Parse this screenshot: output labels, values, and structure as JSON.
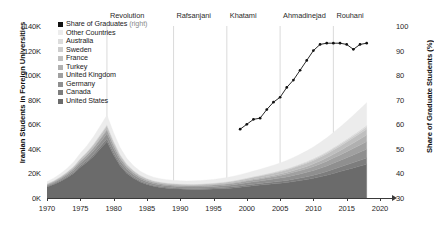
{
  "chart_data": {
    "type": "area",
    "title": "",
    "xlabel": "",
    "ylabel": "Iranian Students in Foreign Universities",
    "y2label": "Share of Graduate Students (%)",
    "xlim": [
      1970,
      2020
    ],
    "ylim": [
      0,
      140000
    ],
    "y2lim": [
      30,
      100
    ],
    "grid": false,
    "legend_position": "upper-left-inside",
    "x": [
      1970,
      1971,
      1972,
      1973,
      1974,
      1975,
      1976,
      1977,
      1978,
      1979,
      1980,
      1981,
      1982,
      1983,
      1984,
      1985,
      1986,
      1987,
      1988,
      1989,
      1990,
      1991,
      1992,
      1993,
      1994,
      1995,
      1996,
      1997,
      1998,
      1999,
      2000,
      2001,
      2002,
      2003,
      2004,
      2005,
      2006,
      2007,
      2008,
      2009,
      2010,
      2011,
      2012,
      2013,
      2014,
      2015,
      2016,
      2017,
      2018
    ],
    "xticks": [
      1970,
      1975,
      1980,
      1985,
      1990,
      1995,
      2000,
      2005,
      2010,
      2015,
      2020
    ],
    "xtick_labels": [
      "1970",
      "1975",
      "1980",
      "1985",
      "1990",
      "1995",
      "2000",
      "2005",
      "2010",
      "2015",
      "2020"
    ],
    "yticks": [
      0,
      20000,
      40000,
      60000,
      80000,
      100000,
      120000,
      140000
    ],
    "ytick_labels": [
      "0K",
      "20K",
      "40K",
      "60K",
      "80K",
      "100K",
      "120K",
      "140K"
    ],
    "y2ticks": [
      30,
      40,
      50,
      60,
      70,
      80,
      90,
      100
    ],
    "y2tick_labels": [
      "30",
      "40",
      "50",
      "60",
      "70",
      "80",
      "90",
      "100"
    ],
    "stack_order_bottom_to_top": [
      "United States",
      "Canada",
      "Germany",
      "United Kingdom",
      "Turkey",
      "France",
      "Sweden",
      "Australia",
      "Other Countries"
    ],
    "series": [
      {
        "name": "United States",
        "color": "#6b6b6b",
        "values": [
          9000,
          11000,
          13500,
          16500,
          20000,
          25000,
          29000,
          34000,
          40000,
          46000,
          35000,
          26000,
          20000,
          16000,
          13000,
          11000,
          9500,
          8600,
          8000,
          7600,
          7300,
          7100,
          7000,
          7000,
          7100,
          7300,
          7500,
          7800,
          8200,
          8800,
          9400,
          10000,
          10500,
          11000,
          11500,
          12000,
          12600,
          13400,
          14200,
          15000,
          16000,
          17200,
          18500,
          20000,
          21500,
          23000,
          24500,
          26000,
          27500
        ]
      },
      {
        "name": "Canada",
        "color": "#7d7d7d",
        "values": [
          400,
          500,
          600,
          750,
          950,
          1200,
          1400,
          1700,
          2000,
          2300,
          1900,
          1500,
          1200,
          1000,
          900,
          800,
          750,
          720,
          700,
          690,
          680,
          680,
          690,
          710,
          740,
          780,
          820,
          870,
          930,
          1000,
          1080,
          1160,
          1250,
          1350,
          1460,
          1580,
          1720,
          1880,
          2060,
          2260,
          2500,
          2760,
          3050,
          3360,
          3700,
          4050,
          4400,
          4750,
          5100
        ]
      },
      {
        "name": "Germany",
        "color": "#8f8f8f",
        "values": [
          800,
          950,
          1150,
          1400,
          1700,
          2100,
          2500,
          2900,
          3400,
          3900,
          3300,
          2700,
          2200,
          1850,
          1600,
          1450,
          1350,
          1290,
          1250,
          1230,
          1220,
          1220,
          1240,
          1270,
          1320,
          1380,
          1450,
          1530,
          1620,
          1730,
          1850,
          1980,
          2120,
          2280,
          2450,
          2640,
          2850,
          3080,
          3330,
          3600,
          3900,
          4220,
          4570,
          4940,
          5330,
          5740,
          6170,
          6620,
          7080
        ]
      },
      {
        "name": "United Kingdom",
        "color": "#a0a0a0",
        "values": [
          600,
          720,
          870,
          1060,
          1290,
          1580,
          1880,
          2200,
          2560,
          2950,
          2500,
          2050,
          1680,
          1400,
          1200,
          1080,
          1000,
          960,
          930,
          915,
          910,
          915,
          930,
          955,
          995,
          1045,
          1105,
          1175,
          1255,
          1345,
          1445,
          1555,
          1675,
          1810,
          1960,
          2125,
          2305,
          2505,
          2725,
          2965,
          3230,
          3520,
          3835,
          4175,
          4540,
          4930,
          5345,
          5780,
          6230
        ]
      },
      {
        "name": "Turkey",
        "color": "#b0b0b0",
        "values": [
          200,
          240,
          290,
          350,
          430,
          530,
          630,
          740,
          860,
          1000,
          850,
          700,
          580,
          490,
          430,
          390,
          365,
          350,
          342,
          338,
          338,
          342,
          352,
          368,
          390,
          418,
          452,
          492,
          540,
          595,
          660,
          735,
          820,
          920,
          1035,
          1165,
          1315,
          1485,
          1680,
          1900,
          2150,
          2430,
          2745,
          3095,
          3480,
          3900,
          4355,
          4840,
          5355
        ]
      },
      {
        "name": "France",
        "color": "#bfbfbf",
        "values": [
          500,
          600,
          730,
          890,
          1080,
          1320,
          1570,
          1840,
          2140,
          2470,
          2100,
          1720,
          1410,
          1180,
          1020,
          920,
          855,
          820,
          800,
          792,
          790,
          795,
          810,
          835,
          870,
          915,
          970,
          1035,
          1110,
          1195,
          1290,
          1395,
          1510,
          1635,
          1770,
          1915,
          2070,
          2235,
          2410,
          2595,
          2790,
          2995,
          3210,
          3435,
          3670,
          3915,
          4170,
          4435,
          4710
        ]
      },
      {
        "name": "Sweden",
        "color": "#cdcdcd",
        "values": [
          150,
          180,
          220,
          270,
          330,
          405,
          485,
          570,
          665,
          770,
          655,
          540,
          445,
          375,
          325,
          293,
          272,
          261,
          255,
          252,
          251,
          253,
          258,
          266,
          278,
          293,
          311,
          332,
          357,
          385,
          417,
          452,
          491,
          534,
          581,
          632,
          687,
          747,
          811,
          880,
          954,
          1033,
          1117,
          1206,
          1301,
          1401,
          1507,
          1618,
          1735
        ]
      },
      {
        "name": "Australia",
        "color": "#dcdcdc",
        "values": [
          120,
          145,
          175,
          215,
          262,
          322,
          385,
          453,
          528,
          612,
          520,
          430,
          354,
          298,
          258,
          233,
          216,
          207,
          202,
          200,
          199,
          201,
          205,
          211,
          221,
          233,
          247,
          264,
          284,
          307,
          333,
          362,
          394,
          429,
          468,
          510,
          556,
          606,
          660,
          718,
          780,
          846,
          917,
          992,
          1072,
          1156,
          1245,
          1339,
          1437
        ]
      },
      {
        "name": "Other Countries",
        "color": "#ececec",
        "values": [
          1500,
          1800,
          2190,
          2670,
          3250,
          3980,
          4740,
          5560,
          6460,
          7460,
          6340,
          5200,
          4270,
          3590,
          3110,
          2800,
          2600,
          2490,
          2430,
          2400,
          2395,
          2410,
          2460,
          2540,
          2650,
          2790,
          2960,
          3160,
          3390,
          3650,
          3940,
          4260,
          4620,
          5020,
          5460,
          5950,
          6490,
          7080,
          7730,
          8440,
          9220,
          10070,
          11000,
          12010,
          13110,
          14300,
          15590,
          16980,
          18470
        ]
      }
    ],
    "line_series": {
      "name": "Share of Graduates (right)",
      "color": "#111111",
      "axis": "right",
      "x": [
        1999,
        2000,
        2001,
        2002,
        2003,
        2004,
        2005,
        2006,
        2007,
        2008,
        2009,
        2010,
        2011,
        2012,
        2013,
        2014,
        2015,
        2016,
        2017,
        2018
      ],
      "values": [
        58,
        60,
        62,
        62.5,
        66,
        69,
        71,
        75,
        78,
        82,
        86,
        90,
        92.5,
        93,
        93,
        93,
        92.5,
        90.5,
        92.5,
        93
      ]
    },
    "annotations": [
      {
        "label": "Revolution",
        "year": 1979
      },
      {
        "label": "Rafsanjani",
        "year": 1989
      },
      {
        "label": "Khatami",
        "year": 1997
      },
      {
        "label": "Ahmadinejad",
        "year": 2005
      },
      {
        "label": "Rouhani",
        "year": 2013
      }
    ]
  },
  "legend": {
    "items": [
      {
        "label": "Share of Graduates (right)",
        "color": "#111111",
        "note": "line"
      },
      {
        "label": "Other Countries",
        "color": "#ececec"
      },
      {
        "label": "Australia",
        "color": "#dcdcdc"
      },
      {
        "label": "Sweden",
        "color": "#cdcdcd"
      },
      {
        "label": "France",
        "color": "#bfbfbf"
      },
      {
        "label": "Turkey",
        "color": "#b0b0b0"
      },
      {
        "label": "United Kingdom",
        "color": "#a0a0a0"
      },
      {
        "label": "Germany",
        "color": "#8f8f8f"
      },
      {
        "label": "Canada",
        "color": "#7d7d7d"
      },
      {
        "label": "United States",
        "color": "#6b6b6b"
      }
    ]
  }
}
